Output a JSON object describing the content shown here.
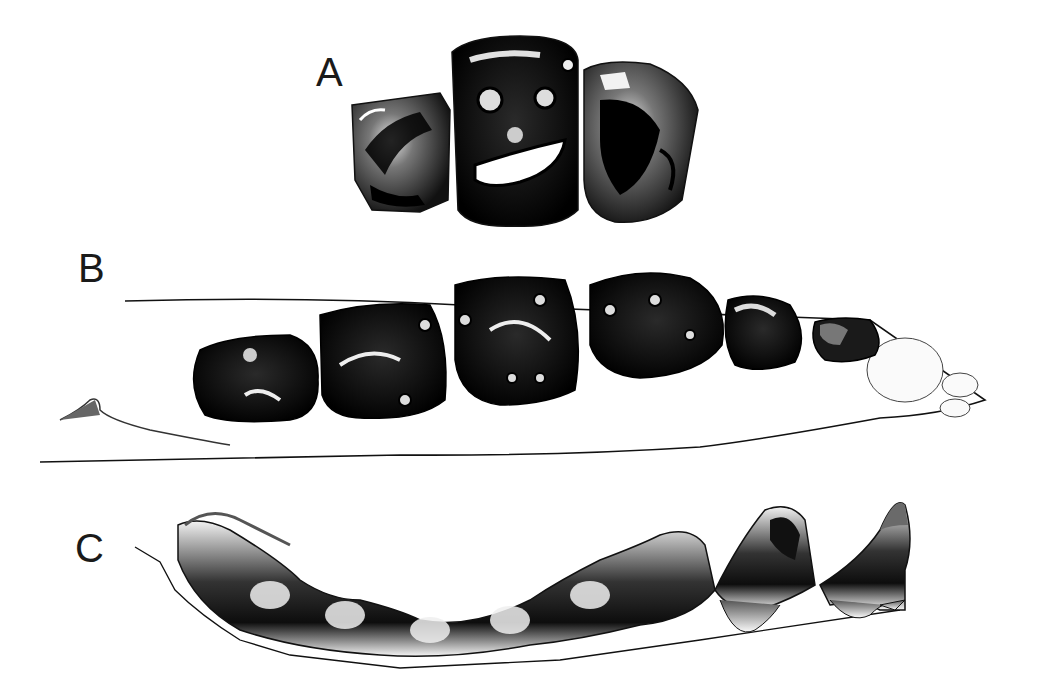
{
  "figure": {
    "panels": [
      {
        "label": "A",
        "description": "Occlusal view of three upper cheek teeth"
      },
      {
        "label": "B",
        "description": "Occlusal view of lower jaw with tooth row (6 teeth) and incisor alveoli"
      },
      {
        "label": "C",
        "description": "Lateral view of lower tooth row with roots"
      }
    ],
    "colors": {
      "ink": "#111111",
      "background": "#ffffff",
      "shade": "#6a6a6a"
    }
  }
}
